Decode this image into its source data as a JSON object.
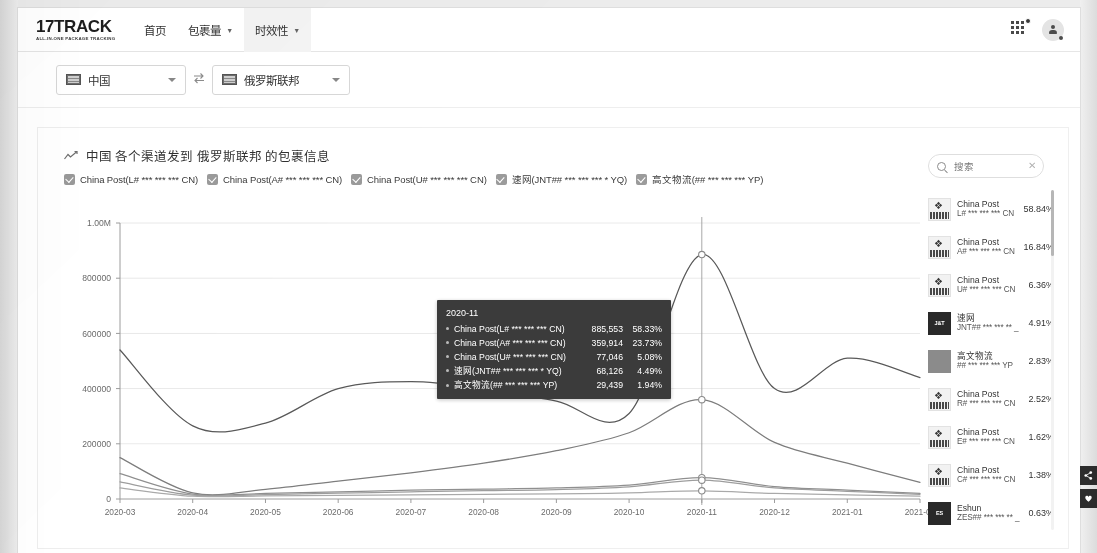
{
  "brand": {
    "logo_main": "17TRACK",
    "logo_sub": "ALL-IN-ONE PACKAGE TRACKING"
  },
  "nav": {
    "items": [
      {
        "label": "首页",
        "has_caret": false,
        "active": false
      },
      {
        "label": "包裹量",
        "has_caret": true,
        "active": false
      },
      {
        "label": "时效性",
        "has_caret": true,
        "active": true
      }
    ],
    "apps_icon": "apps-grid-icon",
    "avatar_icon": "user-avatar-icon"
  },
  "filters": {
    "origin": {
      "label": "中国",
      "icon": "flag-icon"
    },
    "swap_icon": "swap-arrows-icon",
    "destination": {
      "label": "俄罗斯联邦",
      "icon": "flag-icon"
    }
  },
  "card": {
    "title_prefix": "中国",
    "title_mid": "各个渠道发到",
    "title_dest": "俄罗斯联邦",
    "title_suffix": "的包裹信息",
    "title_full": "中国 各个渠道发到 俄罗斯联邦 的包裹信息",
    "trend_icon": "trend-line-icon"
  },
  "legend": [
    {
      "label": "China Post(L# *** *** *** CN)",
      "checked": true
    },
    {
      "label": "China Post(A# *** *** *** CN)",
      "checked": true
    },
    {
      "label": "China Post(U# *** *** *** CN)",
      "checked": true
    },
    {
      "label": "速网(JNT## *** *** *** * YQ)",
      "checked": true
    },
    {
      "label": "高文物流(## *** *** *** YP)",
      "checked": true
    }
  ],
  "tooltip": {
    "date": "2020-11",
    "rows": [
      {
        "name": "China Post(L# *** *** *** CN)",
        "value": "885,553",
        "pct": "58.33%"
      },
      {
        "name": "China Post(A# *** *** *** CN)",
        "value": "359,914",
        "pct": "23.73%"
      },
      {
        "name": "China Post(U# *** *** *** CN)",
        "value": "77,046",
        "pct": "5.08%"
      },
      {
        "name": "速网(JNT## *** *** *** * YQ)",
        "value": "68,126",
        "pct": "4.49%"
      },
      {
        "name": "高文物流(## *** *** *** YP)",
        "value": "29,439",
        "pct": "1.94%"
      }
    ]
  },
  "search": {
    "placeholder": "搜索",
    "value": "",
    "icon": "search-icon",
    "clear_icon": "close-icon"
  },
  "carriers": [
    {
      "name": "China Post",
      "code": "L# *** *** *** CN",
      "pct": "58.84%",
      "logo": "china-post",
      "logo_text": ""
    },
    {
      "name": "China Post",
      "code": "A# *** *** *** CN",
      "pct": "16.84%",
      "logo": "china-post",
      "logo_text": ""
    },
    {
      "name": "China Post",
      "code": "U# *** *** *** CN",
      "pct": "6.36%",
      "logo": "china-post",
      "logo_text": ""
    },
    {
      "name": "速网",
      "code": "JNT## *** *** ** _",
      "pct": "4.91%",
      "logo": "dark",
      "logo_text": "J&T"
    },
    {
      "name": "高文物流",
      "code": "## *** *** *** YP",
      "pct": "2.83%",
      "logo": "gray",
      "logo_text": ""
    },
    {
      "name": "China Post",
      "code": "R# *** *** *** CN",
      "pct": "2.52%",
      "logo": "china-post",
      "logo_text": ""
    },
    {
      "name": "China Post",
      "code": "E# *** *** *** CN",
      "pct": "1.62%",
      "logo": "china-post",
      "logo_text": ""
    },
    {
      "name": "China Post",
      "code": "C# *** *** *** CN",
      "pct": "1.38%",
      "logo": "china-post",
      "logo_text": ""
    },
    {
      "name": "Eshun",
      "code": "ZES## *** *** ** _",
      "pct": "0.63%",
      "logo": "dark",
      "logo_text": "ES"
    }
  ],
  "float_buttons": [
    {
      "icon": "share-icon",
      "name": "share-button"
    },
    {
      "icon": "heart-icon",
      "name": "favorite-button"
    }
  ],
  "chart_data": {
    "type": "line",
    "title": "中国 各个渠道发到 俄罗斯联邦 的包裹信息",
    "xlabel": "",
    "ylabel": "",
    "x": [
      "2020-03",
      "2020-04",
      "2020-05",
      "2020-06",
      "2020-07",
      "2020-08",
      "2020-09",
      "2020-10",
      "2020-11",
      "2020-12",
      "2021-01",
      "2021-02"
    ],
    "yticks": [
      0,
      200000,
      400000,
      600000,
      800000,
      1000000
    ],
    "ytick_labels": [
      "0",
      "200000",
      "400000",
      "600000",
      "800000",
      "1.00M"
    ],
    "ylim": [
      0,
      1000000
    ],
    "grid": true,
    "legend_position": "top",
    "highlight_x": "2020-11",
    "series": [
      {
        "name": "China Post(L# *** *** *** CN)",
        "values": [
          540000,
          265000,
          275000,
          400000,
          425000,
          400000,
          355000,
          310000,
          885553,
          400000,
          510000,
          440000
        ]
      },
      {
        "name": "China Post(A# *** *** *** CN)",
        "values": [
          150000,
          22000,
          35000,
          65000,
          95000,
          130000,
          175000,
          240000,
          359914,
          205000,
          130000,
          60000
        ]
      },
      {
        "name": "China Post(U# *** *** *** CN)",
        "values": [
          92000,
          18000,
          20000,
          26000,
          32000,
          36000,
          40000,
          50000,
          77046,
          45000,
          32000,
          20000
        ]
      },
      {
        "name": "速网(JNT## *** *** *** * YQ)",
        "values": [
          62000,
          14000,
          16000,
          21000,
          26000,
          30000,
          34000,
          44000,
          68126,
          40000,
          28000,
          17000
        ]
      },
      {
        "name": "高文物流(## *** *** *** YP)",
        "values": [
          40000,
          10000,
          11000,
          13000,
          15000,
          17000,
          19000,
          22000,
          29439,
          20000,
          15000,
          10000
        ]
      }
    ]
  }
}
